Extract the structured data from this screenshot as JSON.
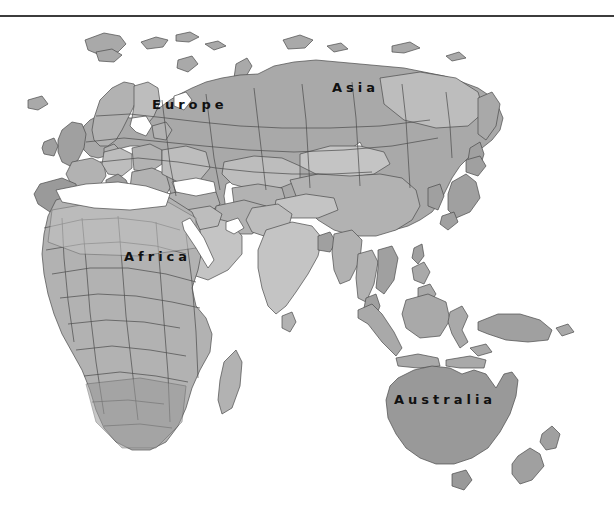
{
  "page": {
    "background_color": "#ffffff"
  },
  "divider": {
    "name": "top-horizontal-rule",
    "color": "#3c3c3c",
    "thickness_px": 2,
    "y_px": 15
  },
  "map": {
    "projection_note": "Eastern Hemisphere political map, grayscale",
    "ocean_color": "#ffffff",
    "border_color": "#4a4a4a",
    "fills": {
      "base": "#a9a9a9",
      "light": "#c4c4c4",
      "lighter": "#bdbdbd",
      "mid": "#b2b2b2",
      "dark": "#9a9a9a",
      "darker": "#8f8f8f",
      "australia": "#999999",
      "islands": "#a0a0a0"
    },
    "labels": [
      {
        "id": "europe",
        "text": "Europe",
        "x": 152,
        "y": 76
      },
      {
        "id": "asia",
        "text": "Asia",
        "x": 332,
        "y": 59
      },
      {
        "id": "africa",
        "text": "Africa",
        "x": 124,
        "y": 228
      },
      {
        "id": "australia",
        "text": "Australia",
        "x": 394,
        "y": 371
      }
    ],
    "label_style": {
      "color": "#111111",
      "font_size_px": 13,
      "letter_spacing_px": 4,
      "weight": "bold"
    },
    "regions_depicted": [
      "Europe",
      "Scandinavia",
      "British Isles",
      "Iberian Peninsula",
      "Russia",
      "Siberia",
      "Svalbard",
      "Novaya Zemlya",
      "Franz Josef Land",
      "Central Asia",
      "Mongolia",
      "China",
      "Korea",
      "Japan",
      "India",
      "Sri Lanka",
      "Middle East",
      "Arabian Peninsula",
      "North Africa",
      "Sahara",
      "Sub-Saharan Africa",
      "Madagascar",
      "Southeast Asia",
      "Indonesia",
      "Philippines",
      "Borneo",
      "New Guinea",
      "Australia",
      "New Zealand",
      "Tasmania"
    ]
  }
}
